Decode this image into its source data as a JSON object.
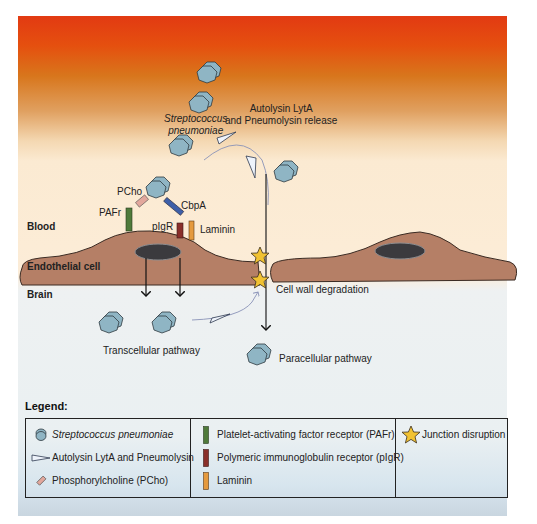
{
  "regions": {
    "blood": "Blood",
    "endothelial_cell": "Endothelial cell",
    "brain": "Brain"
  },
  "labels": {
    "bacteria_line1": "Streptococcus",
    "bacteria_line2": "pneumoniae",
    "release_line1": "Autolysin LytA",
    "release_line2": "and Pneumolysin release",
    "pcho": "PCho",
    "cbpa": "CbpA",
    "pafr": "PAFr",
    "pigr": "pIgR",
    "laminin": "Laminin",
    "cell_wall_degradation": "Cell wall degradation",
    "transcellular": "Transcellular pathway",
    "paracellular": "Paracellular pathway"
  },
  "legend": {
    "title": "Legend:",
    "columns": [
      [
        {
          "icon": "bacteria-icon",
          "label": "Streptococcus pneumoniae",
          "italic": true
        },
        {
          "icon": "toxin-wedge-icon",
          "label": "Autolysin LytA and Pneumolysin"
        },
        {
          "icon": "pcho-icon",
          "label": "Phosphorylcholine (PCho)"
        }
      ],
      [
        {
          "icon": "pafr-bar-icon",
          "label": "Platelet-activating factor receptor (PAFr)",
          "color": "#4f7a3a"
        },
        {
          "icon": "pigr-bar-icon",
          "label": "Polymeric immunoglobulin receptor (pIgR)",
          "color": "#8a2f2a"
        },
        {
          "icon": "laminin-bar-icon",
          "label": "Laminin",
          "color": "#e59a3e"
        }
      ],
      [
        {
          "icon": "star-icon",
          "label": "Junction disruption"
        }
      ]
    ]
  },
  "colors": {
    "bacteria": "#8fb5c4",
    "cell": "#b57f66",
    "nucleus": "#3b3a3e",
    "pafr": "#4f7a3a",
    "pigr": "#8a2f2a",
    "laminin": "#e59a3e",
    "cbpa": "#3e5fa8",
    "pcho": "#e2a79c",
    "star": "#f1c232"
  }
}
